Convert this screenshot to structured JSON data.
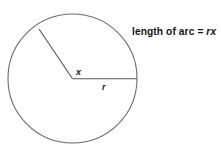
{
  "figure": {
    "background_color": "#ffffff",
    "stroke_color": "#666666",
    "radius_stroke_color": "#595959",
    "text_color": "#141414"
  },
  "caption": {
    "prefix": "length of arc ",
    "equals": "= ",
    "expression": "rx",
    "full_text": "length of arc = rx"
  },
  "labels": {
    "angle": "x",
    "radius": "r"
  },
  "geometry": {
    "circle": {
      "center_x": 72.5,
      "center_y": 78.5,
      "radius": 64.5
    },
    "radius_horizontal": {
      "from_x": 72.5,
      "from_y": 78.5,
      "to_x": 137,
      "to_y": 78.5
    },
    "radius_angled": {
      "from_x": 72.5,
      "from_y": 78.5,
      "to_x": 39,
      "to_y": 29,
      "angle_degrees": 124
    },
    "angle_label_position": {
      "x": 76,
      "y": 74
    },
    "radius_label_position": {
      "x": 102,
      "y": 89
    }
  }
}
